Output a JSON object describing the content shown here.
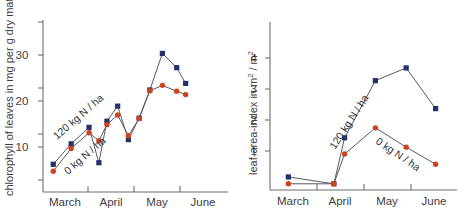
{
  "figure": {
    "panels": [
      "chlorophyll-panel",
      "leaf-area-index-panel"
    ],
    "colors": {
      "series_120kg": "#23306b",
      "series_0kg": "#d2401c",
      "line": "#555a63",
      "axis": "#6d6d6d",
      "text": "#3d3d3d",
      "background": "#ffffff"
    }
  },
  "chart_data": [
    {
      "type": "line",
      "id": "chlorophyll",
      "title": "",
      "xlabel": "",
      "ylabel": "chlorophyll of leaves in mg per g dry matter",
      "ylabel_parts": {
        "main": "chlorophyll of leaves in mg per g dry matter"
      },
      "ytick_labels": [
        "10",
        "20",
        "30"
      ],
      "ytick_values": [
        10,
        20,
        30
      ],
      "ylim": [
        0,
        40
      ],
      "xtick_labels": [
        "March",
        "April",
        "May",
        "June"
      ],
      "grid": false,
      "legend_position": "inline-annotations",
      "annotations": [
        {
          "text": "120 kg N / ha",
          "series": "series_120kg"
        },
        {
          "text": "0 kg N / ha",
          "series": "series_0kg"
        }
      ],
      "x": [
        0.0,
        1.0,
        2.0,
        2.55,
        3.0,
        3.6,
        4.2,
        4.8,
        5.4,
        6.1,
        6.9,
        7.4,
        7.9,
        8.6,
        9.2
      ],
      "series": [
        {
          "name": "120 kg N / ha",
          "color": "#23306b",
          "marker": "square",
          "values": [
            7.2,
            12.5,
            16.8,
            7.6,
            18.4,
            22.3,
            13.6,
            19.2,
            26.5,
            36.0,
            32.3,
            28.2,
            null,
            null,
            null
          ]
        },
        {
          "name": "0 kg N / ha",
          "color": "#d2401c",
          "marker": "circle",
          "values": [
            5.4,
            11.3,
            15.4,
            13.3,
            17.5,
            20.0,
            14.6,
            19.1,
            26.3,
            27.7,
            26.2,
            25.3,
            null,
            null,
            null
          ]
        }
      ]
    },
    {
      "type": "line",
      "id": "leaf-area-index",
      "title": "",
      "xlabel": "",
      "ylabel": "leaf-area-index in m2 / m2",
      "ylabel_parts": {
        "prefix": "leaf-area-index in m",
        "sup1": "2",
        "mid": " / m",
        "sup2": "2"
      },
      "ytick_labels": [
        "1",
        "2",
        "3",
        "4"
      ],
      "ytick_values": [
        1,
        2,
        3,
        4
      ],
      "ylim": [
        0,
        4.7
      ],
      "xtick_labels": [
        "March",
        "April",
        "May",
        "June"
      ],
      "grid": false,
      "legend_position": "inline-annotations",
      "annotations": [
        {
          "text": "120 kg N / ha",
          "series": "series_120kg"
        },
        {
          "text": "0 kg N / ha",
          "series": "series_0kg"
        }
      ],
      "x": [
        0.35,
        2.05,
        2.45,
        3.6,
        4.75,
        5.85
      ],
      "series": [
        {
          "name": "120 kg N / ha",
          "color": "#23306b",
          "marker": "square",
          "values": [
            0.42,
            0.2,
            1.68,
            3.52,
            3.93,
            2.62
          ]
        },
        {
          "name": "0 kg N / ha",
          "color": "#d2401c",
          "marker": "circle",
          "values": [
            0.2,
            0.2,
            1.16,
            2.0,
            1.38,
            0.83
          ]
        }
      ]
    }
  ]
}
